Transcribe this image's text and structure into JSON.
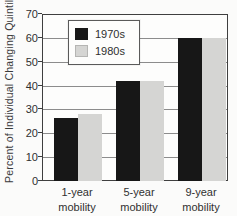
{
  "chart_data": {
    "type": "bar",
    "title": "",
    "ylabel": "Percent of Individual Changing Quintiles",
    "xlabel": "",
    "categories": [
      "1-year\nmobility",
      "5-year\nmobility",
      "9-year\nmobility"
    ],
    "series": [
      {
        "name": "1970s",
        "color": "#171717",
        "values": [
          26.5,
          42,
          60
        ]
      },
      {
        "name": "1980s",
        "color": "#d5d5d3",
        "values": [
          28,
          42,
          60
        ]
      }
    ],
    "ylim": [
      0,
      70
    ],
    "yticks": [
      0,
      10,
      20,
      30,
      40,
      50,
      60,
      70
    ],
    "grid": true,
    "legend_position": "top-left"
  },
  "colors": {
    "bar_1970s": "#171717",
    "bar_1980s": "#d5d5d3",
    "gridline": "#8c8c8c",
    "plot_border": "#3f3f3f",
    "background": "#fbfbfa",
    "text": "#2f2f2f"
  }
}
